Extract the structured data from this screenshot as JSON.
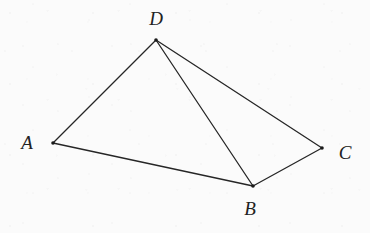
{
  "figure": {
    "kind": "geometry-diagram",
    "canvas": {
      "width": 370,
      "height": 233
    },
    "style": {
      "background_color": "#fbfbfb",
      "stroke_color": "#262626",
      "stroke_width": 1.3,
      "label_color": "#222222",
      "vertex_dot_color": "#1a1a1a",
      "vertex_dot_radius": 1.8
    },
    "vertices": [
      {
        "id": "D",
        "label": "D",
        "x": 156,
        "y": 40,
        "label_x": 156,
        "label_y": 18
      },
      {
        "id": "A",
        "label": "A",
        "x": 53,
        "y": 143,
        "label_x": 27,
        "label_y": 142
      },
      {
        "id": "B",
        "label": "B",
        "x": 253,
        "y": 186,
        "label_x": 250,
        "label_y": 208
      },
      {
        "id": "C",
        "label": "C",
        "x": 322,
        "y": 148,
        "label_x": 345,
        "label_y": 152
      }
    ],
    "edges": [
      {
        "id": "DA",
        "from": "D",
        "to": "A",
        "x1": 156,
        "y1": 40,
        "x2": 53,
        "y2": 143
      },
      {
        "id": "AB",
        "from": "A",
        "to": "B",
        "x1": 53,
        "y1": 143,
        "x2": 253,
        "y2": 186
      },
      {
        "id": "BC",
        "from": "B",
        "to": "C",
        "x1": 253,
        "y1": 186,
        "x2": 322,
        "y2": 148
      },
      {
        "id": "CD",
        "from": "C",
        "to": "D",
        "x1": 322,
        "y1": 148,
        "x2": 156,
        "y2": 40
      },
      {
        "id": "DB",
        "from": "D",
        "to": "B",
        "x1": 156,
        "y1": 40,
        "x2": 253,
        "y2": 186
      }
    ]
  }
}
